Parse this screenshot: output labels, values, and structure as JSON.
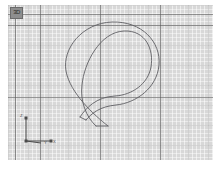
{
  "app": {
    "name": "cad-viewport",
    "background_color": "#ffffff"
  },
  "viewport": {
    "name": "3d-modeling-viewport",
    "background_color": "#d8d8d8",
    "grid": {
      "visible": true,
      "fine_color": "#ffffff",
      "mid_color": "#969696",
      "major_color": "#5a5a5a",
      "fine_spacing_px": 4,
      "mid_spacing_px": 20,
      "major_spacing_x_px": 60,
      "major_spacing_y_px": 72
    },
    "view_label": {
      "text": "3D",
      "tooltip": "3D"
    }
  },
  "axis_triad": {
    "name": "orientation-axes",
    "z_label": "Z",
    "y_label": "Y",
    "x_label": "X",
    "color": "#4a4a4a"
  },
  "model": {
    "name": "swept-hook-profile",
    "description": "Hook / question-mark shaped swept band drawn as two offset spline curves with flat end caps",
    "stroke_color": "#5f5f63",
    "stroke_width": 0.9,
    "fill": "none",
    "outer_path": "M 100 121 C 86 110, 62 88, 58 66 C 54 44, 74 18, 104 17 C 134 16, 153 37, 151 60 C 149 83, 128 98, 108 100 C 92 101.5, 84 108, 78 115",
    "inner_path": "M 88 121 C 78 112, 72 96, 74 80 C 76 58, 92 27, 116 26 C 138 25, 146 45, 143 62 C 140 79, 124 90, 107 91 C 88 92, 78 103, 72 112",
    "cap_lower": "M 78 115 L 72 112",
    "cap_upper": "M 100 121 L 88 121",
    "extent": {
      "left_px": 58,
      "right_px": 153,
      "top_px": 16,
      "bottom_px": 124
    }
  }
}
